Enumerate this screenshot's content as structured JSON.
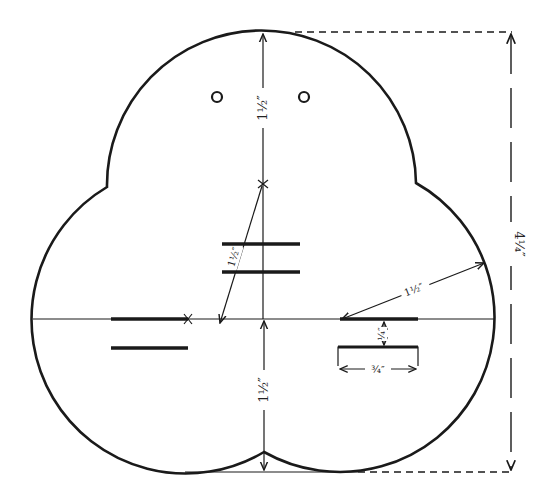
{
  "diagram": {
    "colors": {
      "line": "#1a1a1a",
      "background": "#ffffff"
    },
    "dimensions": {
      "top_radius": "1½″",
      "bottom_radius": "1½″",
      "diagonal_radius": "1½″",
      "right_radius": "1½″",
      "overall_height": "4¼″",
      "slot_gap": "¼″",
      "slot_width": "¾″"
    },
    "features": {
      "holes": 2,
      "center_slots": 2,
      "left_slots": 2,
      "right_slot_with_box": 1
    }
  }
}
